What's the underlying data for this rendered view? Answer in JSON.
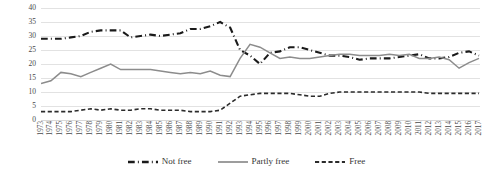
{
  "chart_data": {
    "type": "line",
    "title": "",
    "xlabel": "",
    "ylabel": "",
    "ylim": [
      0,
      40
    ],
    "ytick_step": 5,
    "yticks": [
      40,
      35,
      30,
      25,
      20,
      15,
      10,
      5,
      0
    ],
    "grid": true,
    "legend_position": "bottom",
    "x": [
      1973,
      1974,
      1975,
      1976,
      1977,
      1978,
      1979,
      1980,
      1981,
      1982,
      1983,
      1984,
      1985,
      1986,
      1987,
      1988,
      1989,
      1990,
      1991,
      1992,
      1993,
      1994,
      1995,
      1996,
      1997,
      1998,
      1999,
      2000,
      2001,
      2002,
      2003,
      2004,
      2005,
      2006,
      2007,
      2008,
      2009,
      2010,
      2011,
      2012,
      2013,
      2014,
      2015,
      2016,
      2017
    ],
    "series": [
      {
        "name": "Not free",
        "color": "#1a1a1a",
        "style": "dash-dot",
        "width": 2.1,
        "values": [
          29,
          29,
          29,
          29.5,
          30,
          31.5,
          32,
          32,
          32,
          29.5,
          30,
          30.5,
          30,
          30.5,
          31,
          32.5,
          32.5,
          33.5,
          35,
          33,
          25,
          23,
          20,
          24,
          24.5,
          26,
          26,
          25,
          24,
          23,
          23,
          22.5,
          21.5,
          22,
          22,
          22,
          22.5,
          23,
          23.5,
          22,
          22,
          22.5,
          24,
          24.5,
          23
        ]
      },
      {
        "name": "Partly free",
        "color": "#8c8c8c",
        "style": "solid",
        "width": 1.5,
        "values": [
          13,
          14,
          17,
          16.5,
          15.5,
          17,
          18.5,
          20,
          18,
          18,
          18,
          18,
          17.5,
          17,
          16.5,
          17,
          16.5,
          17.5,
          16,
          15.5,
          22,
          27,
          26,
          24,
          22,
          22.5,
          22,
          22,
          22.5,
          23,
          23.5,
          23.5,
          23,
          23,
          23,
          23.5,
          23,
          23.5,
          22,
          22,
          22.5,
          21.5,
          18.5,
          20.5,
          22
        ]
      },
      {
        "name": "Free",
        "color": "#2b2b2b",
        "style": "dashed",
        "width": 1.6,
        "values": [
          3,
          3,
          3,
          3,
          3.5,
          4,
          3.5,
          4,
          3.5,
          3.5,
          4,
          4,
          3.5,
          3.5,
          3.5,
          3,
          3,
          3,
          3.5,
          6,
          8.5,
          9,
          9.5,
          9.5,
          9.5,
          9.5,
          9,
          8.5,
          8.5,
          9.5,
          10,
          10,
          10,
          10,
          10,
          10,
          10,
          10,
          10,
          9.5,
          9.5,
          9.5,
          9.5,
          9.5,
          9.5
        ]
      }
    ]
  },
  "legend": {
    "items": [
      {
        "label": "Not free",
        "swatch": "dash-dot-swatch"
      },
      {
        "label": "Partly free",
        "swatch": "solid-swatch"
      },
      {
        "label": "Free",
        "swatch": "dashed-swatch"
      }
    ]
  }
}
